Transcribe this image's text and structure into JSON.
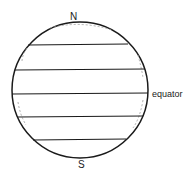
{
  "diagram": {
    "labels": {
      "north": "N",
      "south": "S",
      "equator": "equator"
    },
    "colors": {
      "stroke": "#1a1a1a",
      "shading": "#9a9a9a",
      "background": "#ffffff"
    },
    "bands": 5
  }
}
